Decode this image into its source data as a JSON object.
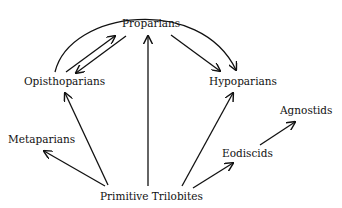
{
  "diagram": {
    "title": "",
    "colors": {
      "line": "#111111",
      "text": "#111111",
      "background": "#ffffff"
    },
    "nodes": {
      "proparians": "Proparians",
      "opisthoparians": "Opisthoparians",
      "hypoparians": "Hypoparians",
      "metaparians": "Metaparians",
      "primitive_trilobites": "Primitive Trilobites",
      "eodiscids": "Eodiscids",
      "agnostids": "Agnostids"
    },
    "edges": [
      {
        "from": "Primitive Trilobites",
        "to": "Metaparians"
      },
      {
        "from": "Primitive Trilobites",
        "to": "Opisthoparians"
      },
      {
        "from": "Primitive Trilobites",
        "to": "Proparians"
      },
      {
        "from": "Primitive Trilobites",
        "to": "Hypoparians"
      },
      {
        "from": "Primitive Trilobites",
        "to": "Eodiscids"
      },
      {
        "from": "Eodiscids",
        "to": "Agnostids"
      },
      {
        "from": "Opisthoparians",
        "to": "Proparians"
      },
      {
        "from": "Proparians",
        "to": "Opisthoparians"
      },
      {
        "from": "Proparians",
        "to": "Hypoparians"
      },
      {
        "from": "Opisthoparians",
        "to": "Hypoparians",
        "style": "arc"
      }
    ]
  }
}
